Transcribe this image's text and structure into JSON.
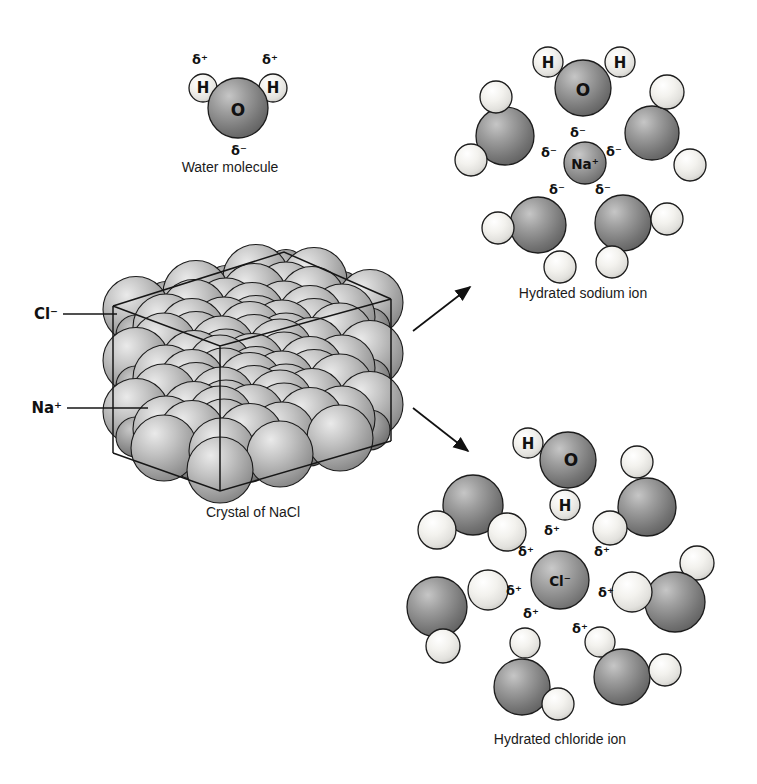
{
  "symbols": {
    "delta_plus": "δ⁺",
    "delta_minus": "δ⁻"
  },
  "water_molecule": {
    "caption": "Water molecule",
    "o": "O",
    "h": "H"
  },
  "crystal": {
    "caption": "Crystal of NaCl",
    "chloride_label": "Cl⁻",
    "sodium_label": "Na⁺"
  },
  "sodium_shell": {
    "caption": "Hydrated sodium ion",
    "ion": "Na⁺",
    "o": "O",
    "h": "H"
  },
  "chloride_shell": {
    "caption": "Hydrated chloride ion",
    "ion": "Cl⁻",
    "o": "O",
    "h": "H"
  },
  "colors": {
    "background": "#ffffff",
    "outline": "#1c1c1c",
    "oxygen_mid": "#8f8f8f",
    "hydrogen_mid": "#f2f1ed",
    "ion_mid": "#9d9d9d",
    "crystal_mid": "#bdbdbd"
  }
}
